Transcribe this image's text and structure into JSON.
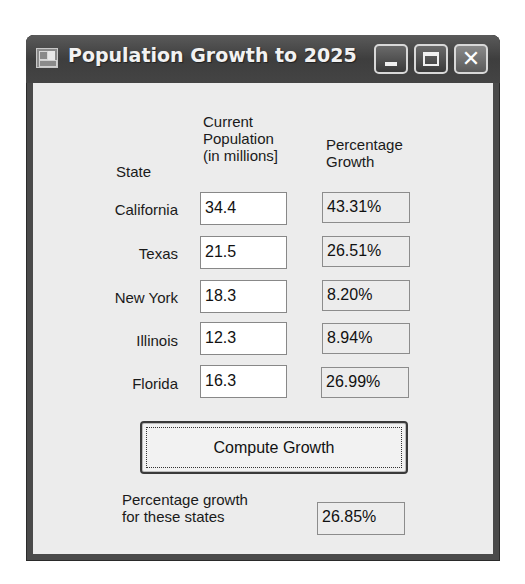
{
  "window": {
    "title": "Population Growth to 2025",
    "icon": "form-app-icon",
    "controls": {
      "minimize": "minimize-icon",
      "maximize": "maximize-icon",
      "close_glyph": "✕"
    }
  },
  "headers": {
    "state": "State",
    "population_line1": "Current",
    "population_line2": "Population",
    "population_line3": "(in millions]",
    "growth_line1": "Percentage",
    "growth_line2": "Growth"
  },
  "rows": [
    {
      "state": "California",
      "population": "34.4",
      "growth": "43.31%"
    },
    {
      "state": "Texas",
      "population": "21.5",
      "growth": "26.51%"
    },
    {
      "state": "New York",
      "population": "18.3",
      "growth": "8.20%"
    },
    {
      "state": "Illinois",
      "population": "12.3",
      "growth": "8.94%"
    },
    {
      "state": "Florida",
      "population": "16.3",
      "growth": "26.99%"
    }
  ],
  "compute_button": {
    "label": "Compute Growth"
  },
  "summary": {
    "label_line1": "Percentage growth",
    "label_line2": "for these states",
    "value": "26.85%"
  }
}
